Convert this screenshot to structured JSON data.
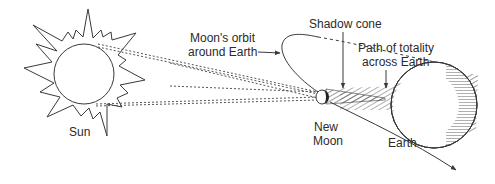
{
  "diagram": {
    "type": "solar-eclipse-geometry",
    "labels": {
      "sun": "Sun",
      "orbit_line1": "Moon's orbit",
      "orbit_line2": "around Earth",
      "shadow_cone": "Shadow cone",
      "path_line1": "Path of totality",
      "path_line2": "across Earth",
      "new_moon_line1": "New",
      "new_moon_line2": "Moon",
      "earth": "Earth"
    },
    "colors": {
      "stroke": "#3a3a3a",
      "background": "#ffffff"
    }
  }
}
